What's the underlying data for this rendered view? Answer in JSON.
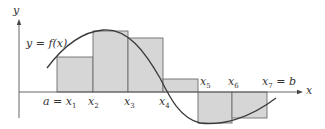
{
  "diagram": {
    "type": "riemann-sum",
    "axes": {
      "x_label": "x",
      "y_label": "y"
    },
    "curve_label": "y = f(x)",
    "partition_labels": [
      {
        "id": "x1",
        "base": "x",
        "sub": "1",
        "prefix": "a = "
      },
      {
        "id": "x2",
        "base": "x",
        "sub": "2",
        "prefix": ""
      },
      {
        "id": "x3",
        "base": "x",
        "sub": "3",
        "prefix": ""
      },
      {
        "id": "x4",
        "base": "x",
        "sub": "4",
        "prefix": ""
      },
      {
        "id": "x5",
        "base": "x",
        "sub": "5",
        "prefix": ""
      },
      {
        "id": "x6",
        "base": "x",
        "sub": "6",
        "prefix": ""
      },
      {
        "id": "x7",
        "base": "x",
        "sub": "7",
        "prefix": "",
        "suffix": " = b"
      }
    ],
    "rectangles": [
      {
        "from": "x1",
        "to": "x2",
        "sign": "positive"
      },
      {
        "from": "x2",
        "to": "x3",
        "sign": "positive"
      },
      {
        "from": "x3",
        "to": "x4",
        "sign": "positive"
      },
      {
        "from": "x4",
        "to": "x5",
        "sign": "positive"
      },
      {
        "from": "x5",
        "to": "x6",
        "sign": "negative"
      },
      {
        "from": "x6",
        "to": "x7",
        "sign": "negative"
      }
    ],
    "colors": {
      "rect_fill": "#d6d6d6",
      "rect_stroke": "#6e6e6e",
      "curve": "#3a3a3a",
      "axis": "#555555",
      "text": "#333333"
    }
  }
}
